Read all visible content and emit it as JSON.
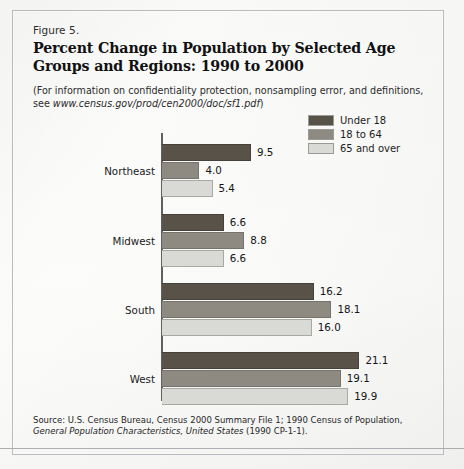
{
  "figure": {
    "number_label": "Figure 5.",
    "title": "Percent Change in Population by Selected Age Groups and Regions:  1990 to 2000",
    "note": "(For information on confidentiality protection, nonsampling error, and definitions, see ",
    "note_link": "www.census.gov/prod/cen2000/doc/sf1.pdf",
    "note_close": ")",
    "source_prefix": "Source:  U.S. Census Bureau, Census 2000 Summary File 1; 1990 Census of Population, ",
    "source_italic": "General Population Characteristics, United States",
    "source_suffix": " (1990 CP-1-1)."
  },
  "colors": {
    "series_under_18": "#595249",
    "series_18_to_64": "#8e8a82",
    "series_65_and_over": "#d9d9d5",
    "axis": "#606060",
    "frame": "#b9bbbd",
    "paper": "#fbfbfa"
  },
  "legend": {
    "position": "top-right",
    "items": [
      {
        "label": "Under 18",
        "color": "#595249"
      },
      {
        "label": "18 to 64",
        "color": "#8e8a82"
      },
      {
        "label": "65 and over",
        "color": "#d9d9d5"
      }
    ]
  },
  "chart_data": {
    "type": "bar",
    "orientation": "horizontal",
    "title": "Percent Change in Population by Selected Age Groups and Regions:  1990 to 2000",
    "subtitle": "Figure 5.",
    "xlabel": "",
    "ylabel": "",
    "categories": [
      "Northeast",
      "Midwest",
      "South",
      "West"
    ],
    "series": [
      {
        "name": "Under 18",
        "color": "#595249",
        "values": [
          9.5,
          6.6,
          16.2,
          21.1
        ]
      },
      {
        "name": "18 to 64",
        "color": "#8e8a82",
        "values": [
          4.0,
          8.8,
          18.1,
          19.1
        ]
      },
      {
        "name": "65 and over",
        "color": "#d9d9d5",
        "values": [
          5.4,
          6.6,
          16.0,
          19.9
        ]
      }
    ],
    "value_labels": [
      [
        "9.5",
        "4.0",
        "5.4"
      ],
      [
        "6.6",
        "8.8",
        "6.6"
      ],
      [
        "16.2",
        "18.1",
        "16.0"
      ],
      [
        "21.1",
        "19.1",
        "19.9"
      ]
    ],
    "xlim": [
      0,
      21.1
    ],
    "grid": false,
    "legend": [
      "Under 18",
      "18 to 64",
      "65 and over"
    ],
    "units": "percent change"
  }
}
